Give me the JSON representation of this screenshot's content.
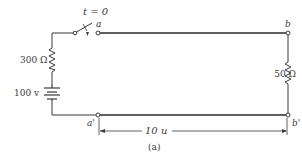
{
  "figure": {
    "caption": "(a)",
    "switch_label": "t = 0",
    "terminals": {
      "a": "a",
      "b": "b",
      "a_prime": "a'",
      "b_prime": "b'"
    },
    "components": {
      "source_resistor": "300 Ω",
      "battery": "100 v",
      "load_resistor": "50 Ω"
    },
    "dimension": "10 u"
  },
  "colors": {
    "line": "#3a3a3a",
    "background": "#ffffff"
  }
}
